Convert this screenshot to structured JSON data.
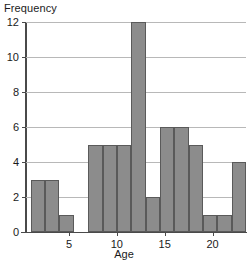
{
  "chart_data": {
    "type": "bar",
    "title": "",
    "xlabel": "Age",
    "ylabel": "Frequency",
    "categories": [
      "1-2.5",
      "2.5-4",
      "4-5.5",
      "5.5-7",
      "7-8.5",
      "8.5-10",
      "10-11.5",
      "11.5-13",
      "13-14.5",
      "14.5-16",
      "16-17.5",
      "17.5-19",
      "19-20.5",
      "20.5-22",
      "22-23.5"
    ],
    "bin_edges": [
      1.0,
      2.5,
      4.0,
      5.5,
      7.0,
      8.5,
      10.0,
      11.5,
      13.0,
      14.5,
      16.0,
      17.5,
      19.0,
      20.5,
      22.0,
      23.5
    ],
    "bins": [
      {
        "x0": 1.0,
        "x1": 2.5,
        "value": 3
      },
      {
        "x0": 2.5,
        "x1": 4.0,
        "value": 3
      },
      {
        "x0": 4.0,
        "x1": 5.5,
        "value": 1
      },
      {
        "x0": 5.5,
        "x1": 7.0,
        "value": 0
      },
      {
        "x0": 7.0,
        "x1": 8.5,
        "value": 5
      },
      {
        "x0": 8.5,
        "x1": 10.0,
        "value": 5
      },
      {
        "x0": 10.0,
        "x1": 11.5,
        "value": 5
      },
      {
        "x0": 11.5,
        "x1": 13.0,
        "value": 12
      },
      {
        "x0": 13.0,
        "x1": 14.5,
        "value": 2
      },
      {
        "x0": 14.5,
        "x1": 16.0,
        "value": 6
      },
      {
        "x0": 16.0,
        "x1": 17.5,
        "value": 6
      },
      {
        "x0": 17.5,
        "x1": 19.0,
        "value": 5
      },
      {
        "x0": 19.0,
        "x1": 20.5,
        "value": 1
      },
      {
        "x0": 20.5,
        "x1": 22.0,
        "value": 1
      },
      {
        "x0": 22.0,
        "x1": 23.5,
        "value": 4
      }
    ],
    "values": [
      3,
      3,
      1,
      0,
      5,
      5,
      5,
      12,
      2,
      6,
      6,
      5,
      1,
      1,
      4
    ],
    "xlim": [
      0.5,
      23.5
    ],
    "ylim": [
      0,
      12
    ],
    "xticks": [
      5,
      10,
      15,
      20
    ],
    "yticks": [
      0,
      2,
      4,
      6,
      8,
      10,
      12
    ],
    "grid": "horizontal",
    "legend": null,
    "bar_color": "#8c8c8c",
    "bar_edge_color": "#5a5a5a",
    "axis_color": "#4a4a4a",
    "gridline_color": "#b8b8b8"
  }
}
